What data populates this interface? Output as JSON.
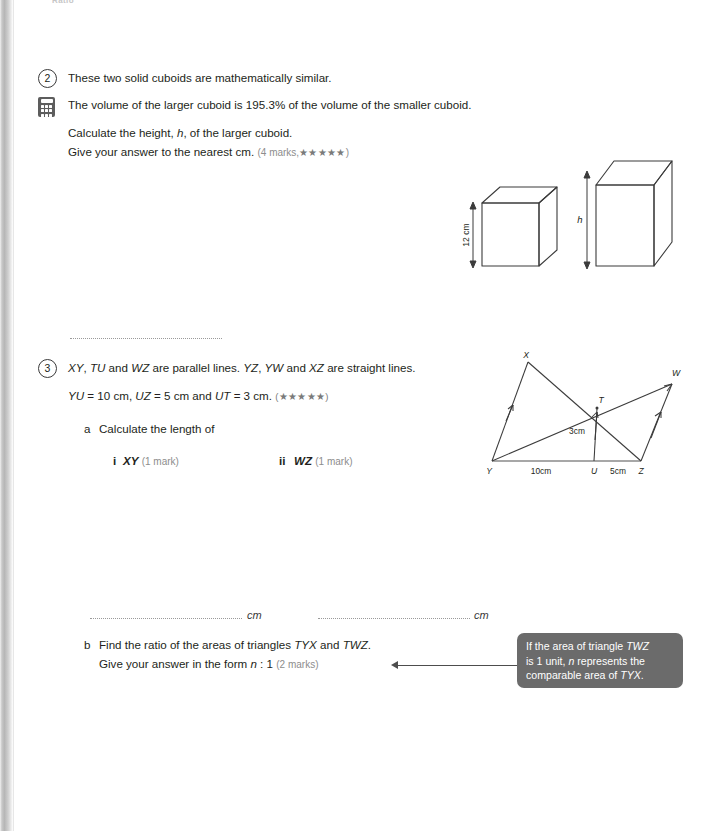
{
  "page": {
    "top_crumb": "Ratio",
    "edge_shade": "#bdbdbd",
    "hint_bg": "#6b6b6b"
  },
  "questions": [
    {
      "number": "2",
      "icon": "calculator-icon",
      "lines": [
        "These two solid cuboids are mathematically similar.",
        "The volume of the larger cuboid is 195.3% of the volume of the smaller cuboid.",
        "Calculate the height, h, of the larger cuboid.",
        "Give your answer to the nearest cm."
      ],
      "line3_pre": "Calculate the height, ",
      "line3_var": "h",
      "line3_post": ", of the larger cuboid.",
      "line4": "Give your answer to the nearest cm.",
      "marks": "(4 marks,",
      "stars": "★★★★★",
      "marks_close": ")",
      "answer_rule": true,
      "figure": {
        "name": "two-similar-cuboids",
        "small_label": "12 cm",
        "large_label": "h"
      }
    },
    {
      "number": "3",
      "line1": "XY, TU and WZ are parallel lines. YZ, YW and XZ are straight lines.",
      "line1_parts": [
        "XY",
        ", ",
        "TU",
        " and ",
        "WZ",
        " are parallel lines. ",
        "YZ",
        ", ",
        "YW",
        " and ",
        "XZ",
        " are straight lines."
      ],
      "line2_parts": [
        "YU",
        " = 10 cm, ",
        "UZ",
        " = 5 cm and ",
        "UT",
        " = 3 cm."
      ],
      "line2_stars": "(★★★★★)",
      "part_a": {
        "letter": "a",
        "text": "Calculate the length of",
        "items": [
          {
            "numeral": "i",
            "label": "XY",
            "marks": "(1 mark)"
          },
          {
            "numeral": "ii",
            "label": "WZ",
            "marks": "(1 mark)"
          }
        ]
      },
      "answers": [
        {
          "unit": "cm"
        },
        {
          "unit": "cm"
        }
      ],
      "part_b": {
        "letter": "b",
        "line1_pre": "Find the ratio of the areas of triangles ",
        "line1_t1": "TYX",
        "line1_mid": " and ",
        "line1_t2": "TWZ",
        "line1_end": ".",
        "line2_pre": "Give your answer in the form ",
        "line2_var": "n",
        "line2_post": " : 1",
        "marks": "(2 marks)"
      },
      "figure": {
        "name": "parallel-lines-triangles",
        "vertices": [
          "X",
          "W",
          "T",
          "Y",
          "U",
          "Z"
        ],
        "labels": [
          "10cm",
          "5cm",
          "3cm"
        ]
      }
    }
  ],
  "hint": {
    "line1_pre": "If the area of triangle ",
    "line1_t": "TWZ",
    "line2_pre": "is 1 unit, ",
    "line2_var": "n",
    "line2_post": " represents the",
    "line3_pre": "comparable area of ",
    "line3_t": "TYX",
    "line3_end": "."
  }
}
